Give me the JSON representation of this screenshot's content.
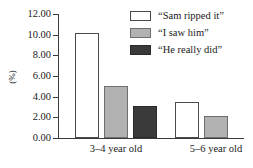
{
  "chart_data": {
    "type": "bar",
    "title": "",
    "xlabel": "",
    "ylabel": "(%)",
    "categories": [
      "3–4 year old",
      "5–6 year old"
    ],
    "series": [
      {
        "name": "“Sam ripped it”",
        "color": "#ffffff",
        "values": [
          10.2,
          3.5
        ]
      },
      {
        "name": "“I saw him”",
        "color": "#b2b2b2",
        "values": [
          5.0,
          2.1
        ]
      },
      {
        "name": "“He really did”",
        "color": "#3a3a3a",
        "values": [
          3.1,
          0.0
        ]
      }
    ],
    "ylim": [
      0,
      12
    ],
    "ytick_values": [
      0,
      2,
      4,
      6,
      8,
      10,
      12
    ],
    "ytick_labels": [
      "0.00",
      "2.00",
      "4.00",
      "6.00",
      "8.00",
      "10.00",
      "12.00"
    ],
    "grid": false,
    "legend_position": "top-right"
  },
  "axis": {
    "y_title": "(%)",
    "y_labels": {
      "t0": "0.00",
      "t2": "2.00",
      "t4": "4.00",
      "t6": "6.00",
      "t8": "8.00",
      "t10": "10.00",
      "t12": "12.00"
    },
    "x_labels": {
      "g0": "3–4 year old",
      "g1": "5–6 year old"
    }
  },
  "legend": {
    "items": [
      {
        "label": "“Sam ripped it”"
      },
      {
        "label": "“I saw him”"
      },
      {
        "label": "“He really did”"
      }
    ]
  }
}
